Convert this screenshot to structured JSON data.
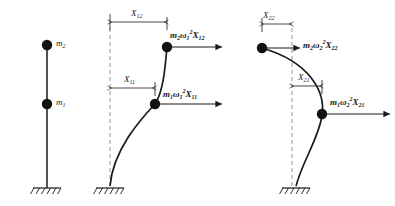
{
  "figure": {
    "type": "structural-mode-shape-diagram",
    "stroke_color": "#1a1a1a",
    "dashed_color": "#8a8a8a",
    "mass_fill": "#111111"
  },
  "panels": [
    {
      "id": "undeformed",
      "name": "undeformed-system",
      "masses": [
        {
          "id": "m2",
          "label_base": "m",
          "label_sub": "2",
          "position": "top"
        },
        {
          "id": "m1",
          "label_base": "m",
          "label_sub": "1",
          "position": "middle"
        }
      ],
      "support": "fixed-base-hatched"
    },
    {
      "id": "mode-1",
      "name": "first-mode-shape",
      "dimensions": [
        {
          "id": "X12",
          "base": "X",
          "sub": "12",
          "at": "top-mass"
        },
        {
          "id": "X11",
          "base": "X",
          "sub": "11",
          "at": "lower-mass"
        }
      ],
      "forces": [
        {
          "id": "F12",
          "mass": "m",
          "mass_sub": "2",
          "omega_sub": "1",
          "omega_sup": "2",
          "amp_base": "X",
          "amp_sub": "12",
          "at": "top-mass",
          "direction": "right"
        },
        {
          "id": "F11",
          "mass": "m",
          "mass_sub": "1",
          "omega_sub": "1",
          "omega_sup": "2",
          "amp_base": "X",
          "amp_sub": "11",
          "at": "lower-mass",
          "direction": "right"
        }
      ],
      "support": "fixed-base-hatched",
      "reference": "vertical-dashed-axis"
    },
    {
      "id": "mode-2",
      "name": "second-mode-shape",
      "dimensions": [
        {
          "id": "X22",
          "base": "X",
          "sub": "22",
          "at": "top-mass"
        },
        {
          "id": "X21",
          "base": "X",
          "sub": "21",
          "at": "lower-mass"
        }
      ],
      "forces": [
        {
          "id": "F22",
          "mass": "m",
          "mass_sub": "2",
          "omega_sub": "2",
          "omega_sup": "2",
          "amp_base": "X",
          "amp_sub": "22",
          "at": "top-mass",
          "direction": "right"
        },
        {
          "id": "F21",
          "mass": "m",
          "mass_sub": "1",
          "omega_sub": "2",
          "omega_sup": "2",
          "amp_base": "X",
          "amp_sub": "21",
          "at": "lower-mass",
          "direction": "right"
        }
      ],
      "support": "fixed-base-hatched",
      "reference": "vertical-dashed-axis"
    }
  ],
  "labels": {
    "m2": "m",
    "m2_sub": "2",
    "m1": "m",
    "m1_sub": "1",
    "X12": "X",
    "X12_sub": "12",
    "X11": "X",
    "X11_sub": "11",
    "X22": "X",
    "X22_sub": "22",
    "X21": "X",
    "X21_sub": "21",
    "omega": "ω",
    "sup2": "2"
  }
}
